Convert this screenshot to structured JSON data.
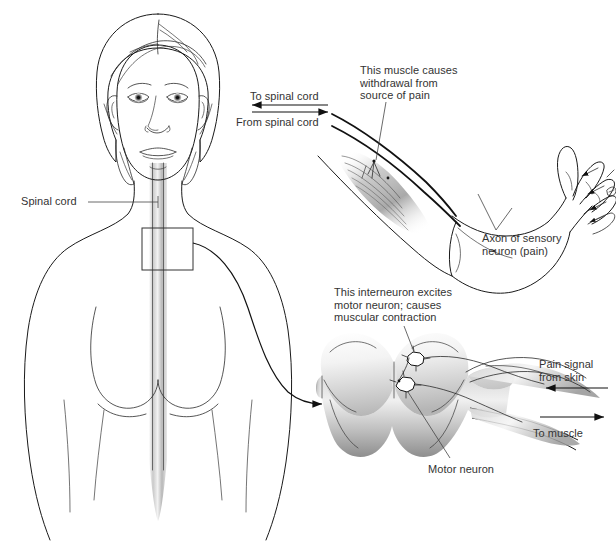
{
  "figure": {
    "background_color": "#ffffff",
    "text_color": "#333333",
    "ink_color": "#1a1a1a"
  },
  "labels": {
    "spinal_cord": "Spinal cord",
    "to_spinal_cord": "To spinal cord",
    "from_spinal_cord": "From spinal cord",
    "muscle_caption": "This muscle causes\nwithdrawal from\nsource of pain",
    "axon_caption": "Axon of sensory\nneuron (pain)",
    "interneuron_caption": "This interneuron excites\nmotor neuron; causes\nmuscular contraction",
    "pain_signal": "Pain signal\nfrom skin",
    "to_muscle": "To muscle",
    "motor_neuron": "Motor neuron"
  },
  "panels": {
    "body": {
      "name": "female torso and head, front view",
      "callout_box": "spinal cord segment highlight"
    },
    "arm": {
      "name": "flexed arm with biceps muscle and hand recoiling from pin"
    },
    "cord_section": {
      "name": "spinal cord cross section with gray matter butterfly"
    }
  },
  "arrows": {
    "to_spinal_cord_direction": "left",
    "from_spinal_cord_direction": "right",
    "pain_signal_direction": "left",
    "to_muscle_direction": "right",
    "callout_direction": "right"
  }
}
